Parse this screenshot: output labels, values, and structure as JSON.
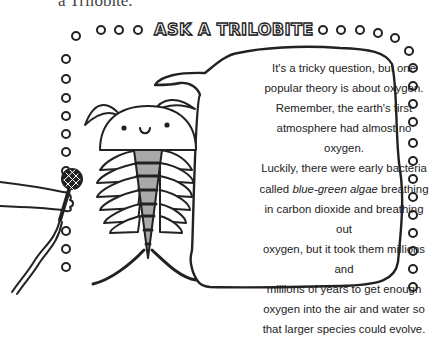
{
  "caption": {
    "partial_text": "a Trilobite."
  },
  "title": {
    "text": "ASK A TRILOBITE"
  },
  "speech_bubble": {
    "lines": [
      {
        "text": "It's a tricky question, but one"
      },
      {
        "text": "popular theory is about oxygen."
      },
      {
        "text": "Remember, the earth's first"
      },
      {
        "text": "atmosphere had almost no oxygen."
      },
      {
        "text": "Luckily, there were early bacteria"
      },
      {
        "pre": "called ",
        "em": "blue-green algae",
        "post": " breathing"
      },
      {
        "text": "in carbon dioxide and breathing out"
      },
      {
        "text": "oxygen, but it took them millions and"
      },
      {
        "text": "millions of years to get enough"
      },
      {
        "text": "oxygen into the air and water so"
      },
      {
        "text": "that larger species could evolve."
      }
    ]
  },
  "illustration": {
    "character": "trilobite-icon",
    "prop": "microphone-icon",
    "colors": {
      "ink": "#222222",
      "body_fill": "#a9a9a9",
      "paper": "#ffffff"
    }
  }
}
